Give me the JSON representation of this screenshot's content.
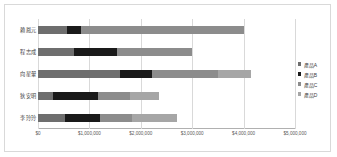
{
  "chart_data": {
    "type": "bar",
    "orientation": "horizontal",
    "stacked": true,
    "title": "",
    "xlabel": "",
    "ylabel": "",
    "categories": [
      "賴鳳元",
      "程志成",
      "向星翬",
      "狄安明",
      "李玲玲"
    ],
    "series": [
      {
        "name": "產品A",
        "color": "#6e6e6e",
        "values": [
          560000,
          700000,
          1600000,
          300000,
          520000
        ]
      },
      {
        "name": "產品B",
        "color": "#1a1a1a",
        "values": [
          270000,
          840000,
          620000,
          870000,
          680000
        ]
      },
      {
        "name": "產品C",
        "color": "#8c8c8c",
        "values": [
          3170000,
          1460000,
          1280000,
          620000,
          620000
        ]
      },
      {
        "name": "產品D",
        "color": "#a6a6a6",
        "values": [
          0,
          0,
          640000,
          560000,
          880000
        ]
      }
    ],
    "totals": [
      4000000,
      3000000,
      4140000,
      2350000,
      2700000
    ],
    "xlim": [
      0,
      5000000
    ],
    "xticks": [
      0,
      1000000,
      2000000,
      3000000,
      4000000,
      5000000
    ],
    "xtick_labels": [
      "$0",
      "$1,000,000",
      "$2,000,000",
      "$3,000,000",
      "$4,000,000",
      "$5,000,000"
    ],
    "grid": true,
    "legend_position": "right"
  },
  "legend": {
    "items": [
      {
        "label": "產品A"
      },
      {
        "label": "產品B"
      },
      {
        "label": "產品C"
      },
      {
        "label": "產品D"
      }
    ]
  }
}
